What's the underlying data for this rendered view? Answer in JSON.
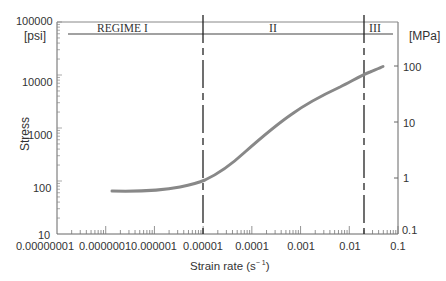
{
  "chart_data": {
    "type": "line",
    "title": "",
    "xlabel": "Strain rate (s⁻¹)",
    "ylabel": "Stress",
    "left_axis_unit": "[psi]",
    "right_axis_unit": "[MPa]",
    "xscale": "log",
    "yscale": "log",
    "xlim": [
      1e-08,
      0.1
    ],
    "ylim": [
      10,
      100000
    ],
    "right_ylim": [
      0.1,
      1000
    ],
    "x_tick_labels": [
      "0.00000001",
      "0.0000001",
      "0.000001",
      "0.00001",
      "0.0001",
      "0.001",
      "0.01",
      "0.1"
    ],
    "y_tick_labels": [
      "10",
      "100",
      "1000",
      "10000",
      "100000"
    ],
    "right_y_tick_labels": [
      "0.1",
      "1",
      "10",
      "100"
    ],
    "grid": false,
    "legend": null,
    "regimes": [
      {
        "label": "REGIME I",
        "x_start": 1e-08,
        "x_end": 1e-05
      },
      {
        "label": "II",
        "x_start": 1e-05,
        "x_end": 0.02
      },
      {
        "label": "III",
        "x_start": 0.02,
        "x_end": 0.1
      }
    ],
    "regime_boundaries": [
      1e-05,
      0.02
    ],
    "series": [
      {
        "name": "Stress vs strain rate",
        "x": [
          1.3e-07,
          8e-07,
          2.7e-06,
          1e-05,
          3.6e-05,
          0.00015,
          0.001,
          0.004,
          0.02,
          0.05
        ],
        "y": [
          65,
          63,
          74,
          100,
          200,
          550,
          1800,
          4000,
          9800,
          15000
        ]
      }
    ]
  },
  "labels": {
    "left_unit": "[psi]",
    "right_unit": "[MPa]",
    "ylabel": "Stress",
    "xlabel": "Strain rate (s",
    "xlabel_sup": "− 1",
    "xlabel_close": ")",
    "regime1": "REGIME I",
    "regime2": "II",
    "regime3": "III",
    "yticks": [
      "100000",
      "10000",
      "1000",
      "100",
      "10"
    ],
    "rticks": [
      "100",
      "10",
      "1",
      "0.1"
    ],
    "xticks": [
      "0.00000001",
      "0.0000001",
      "0.000001",
      "0.00001",
      "0.0001",
      "0.001",
      "0.01",
      "0.1"
    ]
  }
}
